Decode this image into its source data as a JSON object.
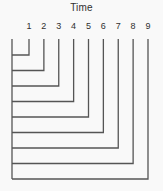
{
  "title": "Time",
  "diagram": {
    "tick_labels": [
      "1",
      "2",
      "3",
      "4",
      "5",
      "6",
      "7",
      "8",
      "9"
    ],
    "line_color": "#555555",
    "text_color": "#303030",
    "background_color": "#f9f9f9"
  }
}
